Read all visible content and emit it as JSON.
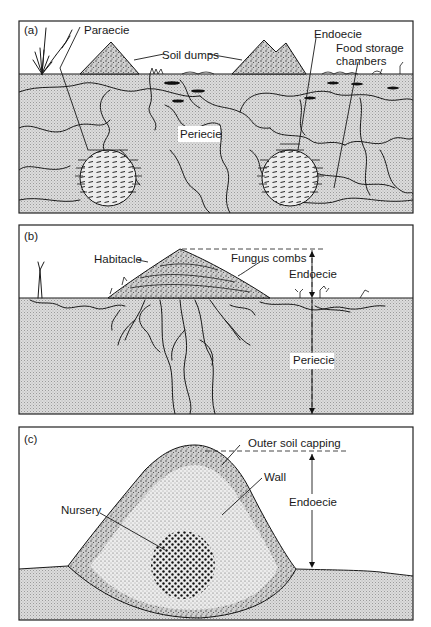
{
  "figure": {
    "panels": [
      {
        "id": "a",
        "tag": "(a)",
        "labels": {
          "paraecie": "Paraecie",
          "soil_dumps": "Soil dumps",
          "endoecie": "Endoecie",
          "food_storage_line1": "Food storage",
          "food_storage_line2": "chambers",
          "periecie": "Periecie"
        }
      },
      {
        "id": "b",
        "tag": "(b)",
        "labels": {
          "habitacle": "Habitacle",
          "fungus_combs": "Fungus combs",
          "endoecie": "Endoecie",
          "periecie": "Periecie"
        }
      },
      {
        "id": "c",
        "tag": "(c)",
        "labels": {
          "outer_soil_capping": "Outer soil capping",
          "wall": "Wall",
          "nursery": "Nursery",
          "endoecie": "Endoecie"
        }
      }
    ],
    "colors": {
      "soil_fill": "#d9d9d9",
      "ink": "#1a1a1a",
      "background": "#ffffff"
    }
  }
}
